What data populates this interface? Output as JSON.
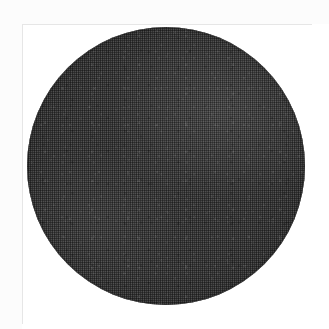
{
  "figure": {
    "kind": "scanned-halftone-photograph",
    "subject_name": "dark-filled-circle",
    "caption": "",
    "title": "",
    "label": "",
    "has_text": false,
    "has_axes": false,
    "has_legend": false,
    "page_background_color": "#fcfcfc",
    "panel_background_color": "#ffffff",
    "panel_rule_color": "#e6e6e6",
    "shape": {
      "type": "circle",
      "fill_color": "#333333",
      "rim_color": "#5a5a5a",
      "center_x_px": 166,
      "center_y_px": 166,
      "diameter_px": 278,
      "texture": "halftone-dither",
      "tone": "dark charcoal gray",
      "lighter_region": "upper-right"
    },
    "canvas": {
      "width_px": 329,
      "height_px": 329
    }
  }
}
